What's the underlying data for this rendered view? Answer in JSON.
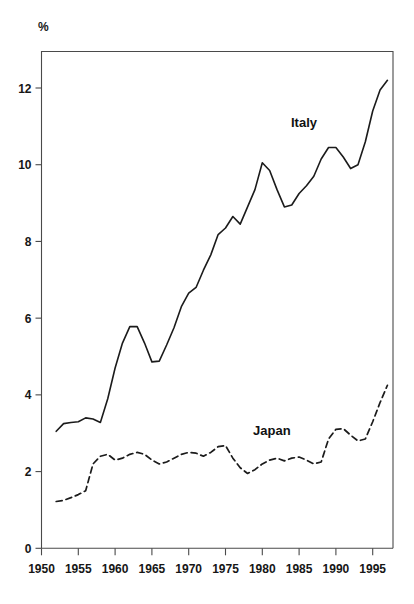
{
  "chart_data": {
    "type": "line",
    "title": "",
    "subtitle": "",
    "xlabel": "",
    "ylabel": "%",
    "unit_label": "%",
    "xlim": [
      1950,
      1997.5
    ],
    "ylim": [
      0,
      13.1
    ],
    "grid": false,
    "legend": "inline-labels",
    "x_ticks": [
      1950,
      1955,
      1960,
      1965,
      1970,
      1975,
      1980,
      1985,
      1990,
      1995
    ],
    "x_tick_labels": [
      "1950",
      "1955",
      "1960",
      "1965",
      "1970",
      "1975",
      "1980",
      "1985",
      "1990",
      "1995"
    ],
    "y_ticks": [
      0,
      2,
      4,
      6,
      8,
      10,
      12
    ],
    "y_tick_labels": [
      "0",
      "2",
      "4",
      "6",
      "8",
      "10",
      "12"
    ],
    "x": [
      1952,
      1953,
      1954,
      1955,
      1956,
      1957,
      1958,
      1959,
      1960,
      1961,
      1962,
      1963,
      1964,
      1965,
      1966,
      1967,
      1968,
      1969,
      1970,
      1971,
      1972,
      1973,
      1974,
      1975,
      1976,
      1977,
      1978,
      1979,
      1980,
      1981,
      1982,
      1983,
      1984,
      1985,
      1986,
      1987,
      1988,
      1989,
      1990,
      1991,
      1992,
      1993,
      1994,
      1995,
      1996,
      1997
    ],
    "series": [
      {
        "name": "Italy",
        "style": "solid",
        "color": "#1b1b1b",
        "values": [
          3.05,
          3.25,
          3.28,
          3.3,
          3.4,
          3.37,
          3.28,
          3.9,
          4.7,
          5.35,
          5.78,
          5.78,
          5.35,
          4.86,
          4.88,
          5.3,
          5.75,
          6.3,
          6.65,
          6.8,
          7.25,
          7.65,
          8.18,
          8.35,
          8.65,
          8.45,
          8.9,
          9.35,
          10.05,
          9.85,
          9.35,
          8.9,
          8.95,
          9.25,
          9.45,
          9.7,
          10.15,
          10.45,
          10.45,
          10.2,
          9.9,
          10.0,
          10.6,
          11.4,
          11.95,
          12.2
        ]
      },
      {
        "name": "Japan",
        "style": "dashed",
        "color": "#1b1b1b",
        "values": [
          1.22,
          1.25,
          1.32,
          1.4,
          1.5,
          2.2,
          2.4,
          2.45,
          2.3,
          2.35,
          2.45,
          2.5,
          2.45,
          2.3,
          2.2,
          2.25,
          2.35,
          2.45,
          2.5,
          2.48,
          2.4,
          2.5,
          2.65,
          2.68,
          2.35,
          2.1,
          1.95,
          2.05,
          2.2,
          2.3,
          2.35,
          2.28,
          2.35,
          2.38,
          2.3,
          2.2,
          2.25,
          2.85,
          3.1,
          3.12,
          2.95,
          2.8,
          2.85,
          3.3,
          3.8,
          4.25
        ]
      }
    ],
    "annotations": [
      {
        "text": "Italy",
        "x": 1986.5,
        "y": 11.3
      },
      {
        "text": "Japan",
        "x": 1981.5,
        "y": 3.1
      }
    ]
  },
  "axes": {
    "y_unit": "%"
  }
}
